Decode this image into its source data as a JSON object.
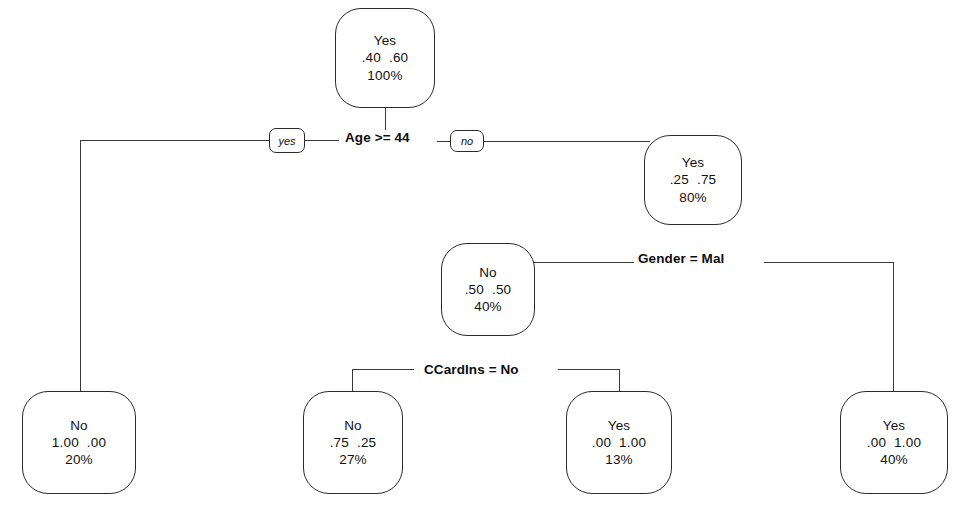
{
  "diagram": {
    "type": "decision-tree",
    "line_color": "#3a3a3a",
    "node_border_color": "#2b2b2b",
    "node_fill": "#ffffff",
    "text_color": "#111111"
  },
  "nodes": [
    {
      "id": "root",
      "role": "root",
      "prediction": "Yes",
      "probabilities": ".40  .60",
      "percent": "100%",
      "x": 335,
      "y": 8,
      "w": 100,
      "h": 100
    },
    {
      "id": "age-no",
      "role": "internal",
      "prediction": "Yes",
      "probabilities": ".25  .75",
      "percent": "80%",
      "x": 644,
      "y": 135,
      "w": 98,
      "h": 90
    },
    {
      "id": "gender-left",
      "role": "internal",
      "prediction": "No",
      "probabilities": ".50  .50",
      "percent": "40%",
      "x": 441,
      "y": 243,
      "w": 94,
      "h": 93
    },
    {
      "id": "leaf-age-yes",
      "role": "leaf",
      "prediction": "No",
      "probabilities": "1.00  .00",
      "percent": "20%",
      "x": 22,
      "y": 391,
      "w": 114,
      "h": 103
    },
    {
      "id": "leaf-ccardins-yes",
      "role": "leaf",
      "prediction": "No",
      "probabilities": ".75  .25",
      "percent": "27%",
      "x": 303,
      "y": 391,
      "w": 100,
      "h": 103
    },
    {
      "id": "leaf-ccardins-no",
      "role": "leaf",
      "prediction": "Yes",
      "probabilities": ".00  1.00",
      "percent": "13%",
      "x": 566,
      "y": 391,
      "w": 106,
      "h": 103
    },
    {
      "id": "leaf-gender-right",
      "role": "leaf",
      "prediction": "Yes",
      "probabilities": ".00  1.00",
      "percent": "40%",
      "x": 840,
      "y": 391,
      "w": 108,
      "h": 103
    }
  ],
  "splits": [
    {
      "id": "split-age",
      "label": "Age >= 44",
      "x": 345,
      "y": 130
    },
    {
      "id": "split-gender",
      "label": "Gender = Mal",
      "x": 638,
      "y": 251
    },
    {
      "id": "split-ccardins",
      "label": "CCardIns = No",
      "x": 424,
      "y": 362
    }
  ],
  "edge_badges": [
    {
      "id": "badge-yes",
      "label": "yes",
      "x": 269,
      "y": 128,
      "w": 36,
      "h": 25
    },
    {
      "id": "badge-no",
      "label": "no",
      "x": 450,
      "y": 130,
      "w": 34,
      "h": 22
    }
  ]
}
